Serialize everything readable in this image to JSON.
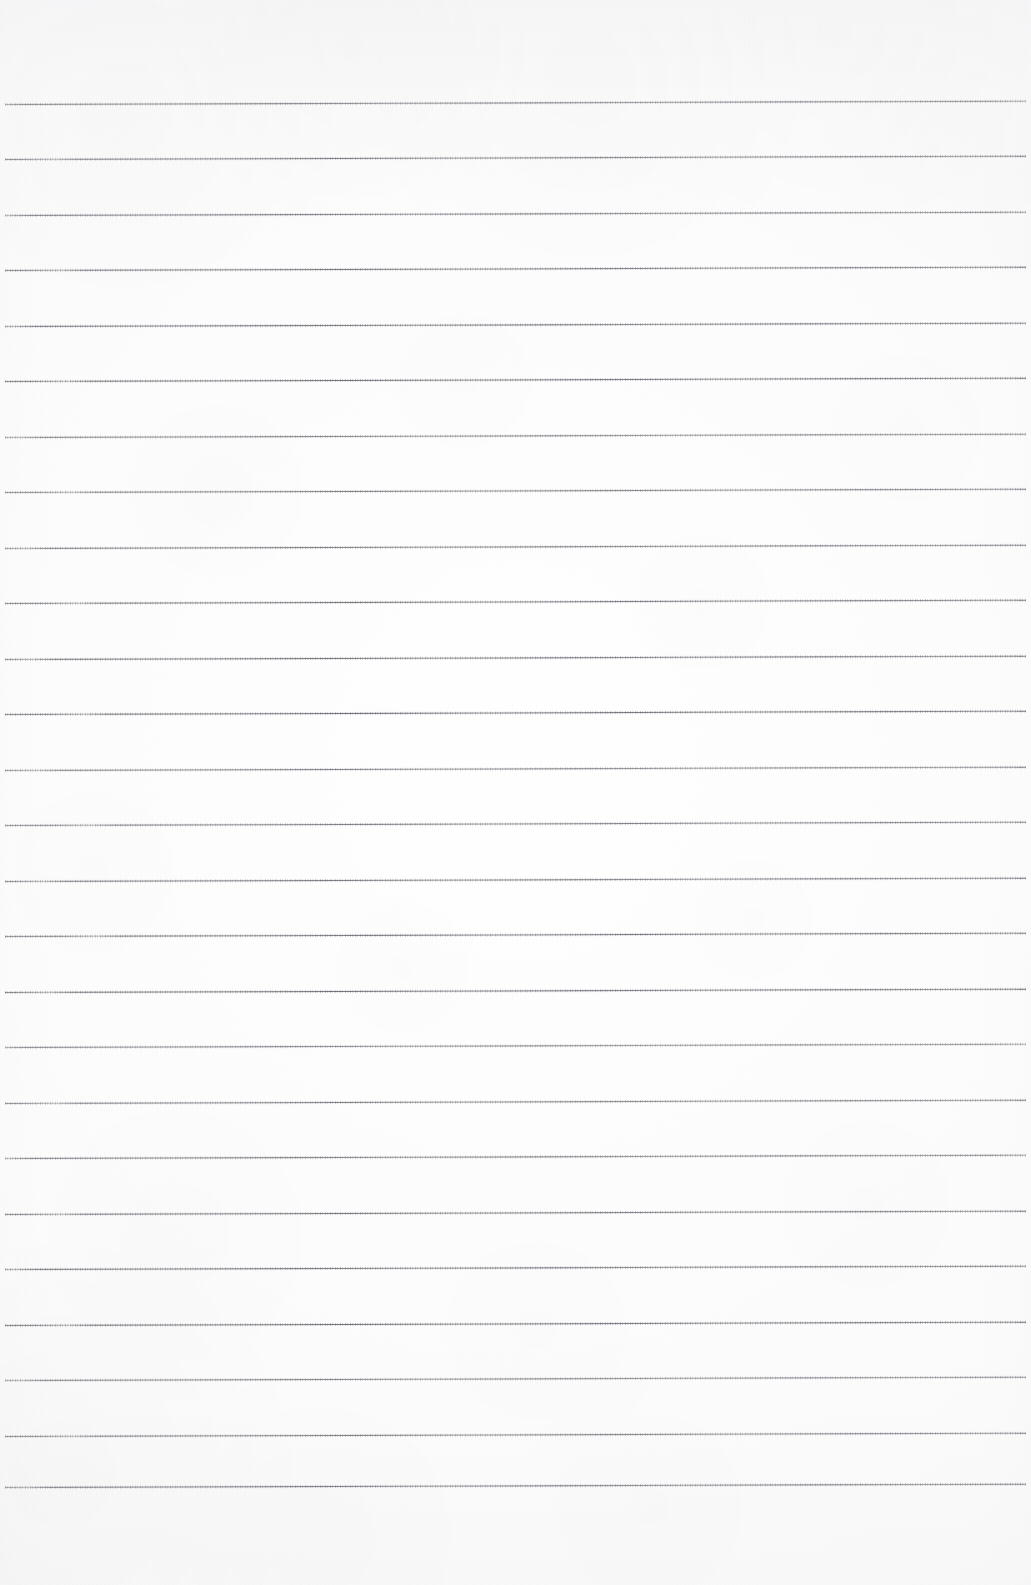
{
  "document": {
    "kind": "scanned-lined-notebook-paper",
    "title": "Blank Lined Notebook Page",
    "page_width": 1031,
    "page_height": 1585,
    "content_text": "",
    "has_handwriting": false,
    "has_printed_text": false,
    "has_margin_rule": false
  },
  "paper": {
    "background_color": "#fcfcfc",
    "tint_color": "#f4f4f6",
    "texture": "scan-grain",
    "edge_shading": {
      "top": true,
      "bottom_left": true,
      "left": true,
      "right": true
    }
  },
  "ruling": {
    "line_color": "#6a6a73",
    "line_opacity": 0.88,
    "line_thickness_px": 1.25,
    "line_spacing_px": 55.5,
    "first_line_y": 104,
    "last_line_y": 1487,
    "line_start_x": 5,
    "line_end_x": 1026,
    "line_count": 26,
    "skew_rise_px": -3.2,
    "top_margin_px": 104,
    "bottom_margin_px": 98,
    "lines_y": [
      104.0,
      159.5,
      215.0,
      270.5,
      326.0,
      381.5,
      437.0,
      492.5,
      548.0,
      603.5,
      659.0,
      714.5,
      770.0,
      825.5,
      881.0,
      936.5,
      992.0,
      1047.5,
      1103.0,
      1158.5,
      1214.0,
      1269.5,
      1325.0,
      1380.5,
      1436.0,
      1487.0
    ]
  }
}
